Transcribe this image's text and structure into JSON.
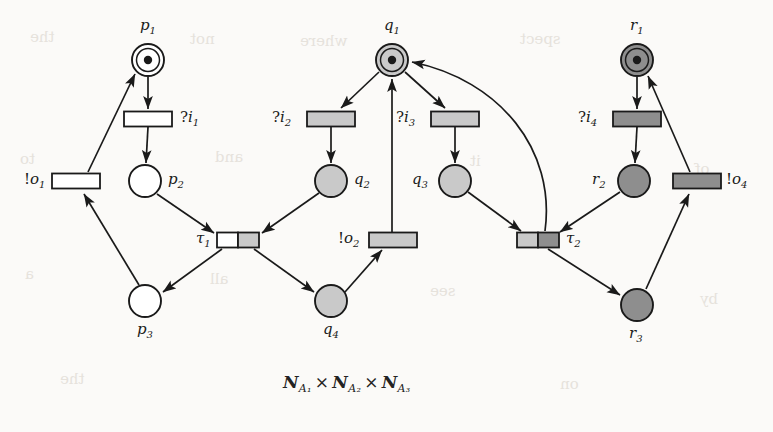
{
  "figure": {
    "caption_parts": {
      "n1": "N",
      "sub1": "A₁",
      "times1": "×",
      "n2": "N",
      "sub2": "A₂",
      "times2": "×",
      "n3": "N",
      "sub3": "A₃"
    },
    "caption_text": "N_A1 × N_A2 × N_A3",
    "background_color": "#fbfaf8",
    "ink_color": "#1a1a1a"
  },
  "palette": {
    "white_fill": "#ffffff",
    "light_gray_fill": "#c9c9c9",
    "dark_gray_fill": "#8e8e8e",
    "stroke": "#1a1a1a"
  },
  "places": [
    {
      "id": "p1",
      "label": "p",
      "sub": "1",
      "cx": 148,
      "cy": 60,
      "r": 16,
      "fill": "#ffffff",
      "double_ring": true,
      "token": true,
      "label_x": 140,
      "label_y": 18
    },
    {
      "id": "p2",
      "label": "p",
      "sub": "2",
      "cx": 145,
      "cy": 181,
      "r": 16,
      "fill": "#ffffff",
      "double_ring": false,
      "token": false,
      "label_x": 168,
      "label_y": 172
    },
    {
      "id": "p3",
      "label": "p",
      "sub": "3",
      "cx": 145,
      "cy": 301,
      "r": 16,
      "fill": "#ffffff",
      "double_ring": false,
      "token": false,
      "label_x": 137,
      "label_y": 322
    },
    {
      "id": "q1",
      "label": "q",
      "sub": "1",
      "cx": 392,
      "cy": 60,
      "r": 16,
      "fill": "#c9c9c9",
      "double_ring": true,
      "token": true,
      "label_x": 384,
      "label_y": 18
    },
    {
      "id": "q2",
      "label": "q",
      "sub": "2",
      "cx": 331,
      "cy": 181,
      "r": 16,
      "fill": "#c9c9c9",
      "double_ring": false,
      "token": false,
      "label_x": 354,
      "label_y": 172
    },
    {
      "id": "q3",
      "label": "q",
      "sub": "3",
      "cx": 455,
      "cy": 181,
      "r": 16,
      "fill": "#c9c9c9",
      "double_ring": false,
      "token": false,
      "label_x": 412,
      "label_y": 172
    },
    {
      "id": "q4",
      "label": "q",
      "sub": "4",
      "cx": 331,
      "cy": 301,
      "r": 16,
      "fill": "#c9c9c9",
      "double_ring": false,
      "token": false,
      "label_x": 323,
      "label_y": 322
    },
    {
      "id": "r1",
      "label": "r",
      "sub": "1",
      "cx": 637,
      "cy": 60,
      "r": 16,
      "fill": "#8e8e8e",
      "double_ring": true,
      "token": true,
      "label_x": 630,
      "label_y": 18
    },
    {
      "id": "r2",
      "label": "r",
      "sub": "2",
      "cx": 634,
      "cy": 181,
      "r": 16,
      "fill": "#8e8e8e",
      "double_ring": false,
      "token": false,
      "label_x": 592,
      "label_y": 172
    },
    {
      "id": "r3",
      "label": "r",
      "sub": "3",
      "cx": 637,
      "cy": 305,
      "r": 16,
      "fill": "#8e8e8e",
      "double_ring": false,
      "token": false,
      "label_x": 629,
      "label_y": 326
    }
  ],
  "transitions": [
    {
      "id": "i1",
      "label": "?i",
      "sub": "1",
      "prefix": "?",
      "cx": 148,
      "cy": 119,
      "w": 48,
      "h": 15,
      "fills": [
        "#ffffff"
      ],
      "label_x": 180,
      "label_y": 110
    },
    {
      "id": "o1",
      "label": "!o",
      "sub": "1",
      "prefix": "!",
      "cx": 76,
      "cy": 181,
      "w": 48,
      "h": 15,
      "fills": [
        "#ffffff"
      ],
      "label_x": 24,
      "label_y": 172
    },
    {
      "id": "t1",
      "label": "τ",
      "sub": "1",
      "prefix": "",
      "cx": 238,
      "cy": 240,
      "w": 42,
      "h": 15,
      "fills": [
        "#ffffff",
        "#c9c9c9"
      ],
      "label_x": 196,
      "label_y": 231
    },
    {
      "id": "i2",
      "label": "?i",
      "sub": "2",
      "prefix": "?",
      "cx": 331,
      "cy": 119,
      "w": 48,
      "h": 15,
      "fills": [
        "#c9c9c9"
      ],
      "label_x": 272,
      "label_y": 110
    },
    {
      "id": "i3",
      "label": "?i",
      "sub": "3",
      "prefix": "?",
      "cx": 455,
      "cy": 119,
      "w": 48,
      "h": 15,
      "fills": [
        "#c9c9c9"
      ],
      "label_x": 396,
      "label_y": 110
    },
    {
      "id": "o2",
      "label": "!o",
      "sub": "2",
      "prefix": "!",
      "cx": 393,
      "cy": 240,
      "w": 48,
      "h": 15,
      "fills": [
        "#c9c9c9"
      ],
      "label_x": 338,
      "label_y": 231
    },
    {
      "id": "t2",
      "label": "τ",
      "sub": "2",
      "prefix": "",
      "cx": 538,
      "cy": 240,
      "w": 42,
      "h": 15,
      "fills": [
        "#c9c9c9",
        "#8e8e8e"
      ],
      "label_x": 566,
      "label_y": 231
    },
    {
      "id": "i4",
      "label": "?i",
      "sub": "4",
      "prefix": "?",
      "cx": 637,
      "cy": 119,
      "w": 48,
      "h": 15,
      "fills": [
        "#8e8e8e"
      ],
      "label_x": 578,
      "label_y": 110
    },
    {
      "id": "o4",
      "label": "!o",
      "sub": "4",
      "prefix": "!",
      "cx": 697,
      "cy": 181,
      "w": 48,
      "h": 15,
      "fills": [
        "#8e8e8e"
      ],
      "label_x": 726,
      "label_y": 172
    }
  ],
  "arcs": [
    {
      "from": "p1",
      "to": "i1",
      "kind": "straight"
    },
    {
      "from": "i1",
      "to": "p2",
      "kind": "straight"
    },
    {
      "from": "p2",
      "to": "t1",
      "kind": "straight"
    },
    {
      "from": "t1",
      "to": "p3",
      "kind": "straight"
    },
    {
      "from": "p3",
      "to": "o1",
      "kind": "straight"
    },
    {
      "from": "o1",
      "to": "p1",
      "kind": "straight"
    },
    {
      "from": "q1",
      "to": "i2",
      "kind": "straight"
    },
    {
      "from": "i2",
      "to": "q2",
      "kind": "straight"
    },
    {
      "from": "q2",
      "to": "t1",
      "kind": "straight"
    },
    {
      "from": "t1",
      "to": "q4",
      "kind": "straight"
    },
    {
      "from": "q4",
      "to": "o2",
      "kind": "straight"
    },
    {
      "from": "o2",
      "to": "q1",
      "kind": "straight"
    },
    {
      "from": "q1",
      "to": "i3",
      "kind": "straight"
    },
    {
      "from": "i3",
      "to": "q3",
      "kind": "straight"
    },
    {
      "from": "q3",
      "to": "t2",
      "kind": "straight"
    },
    {
      "from": "t2",
      "to": "q1",
      "kind": "curved"
    },
    {
      "from": "r1",
      "to": "i4",
      "kind": "straight"
    },
    {
      "from": "i4",
      "to": "r2",
      "kind": "straight"
    },
    {
      "from": "r2",
      "to": "t2",
      "kind": "straight"
    },
    {
      "from": "t2",
      "to": "r3",
      "kind": "straight"
    },
    {
      "from": "r3",
      "to": "o4",
      "kind": "straight"
    },
    {
      "from": "o4",
      "to": "r1",
      "kind": "straight"
    }
  ]
}
